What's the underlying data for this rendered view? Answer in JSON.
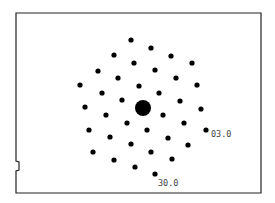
{
  "diagram": {
    "type": "diffraction-pattern",
    "frame": {
      "x": 16,
      "y": 13,
      "width": 245,
      "height": 180,
      "stroke": "#222222"
    },
    "center_spot": {
      "x": 143,
      "y": 108,
      "r": 8
    },
    "spot_radius": 2.6,
    "spot_color": "#000000",
    "spots": [
      [
        131,
        40
      ],
      [
        151,
        48
      ],
      [
        114,
        55
      ],
      [
        171,
        56
      ],
      [
        134,
        63
      ],
      [
        192,
        63
      ],
      [
        98,
        71
      ],
      [
        155,
        70
      ],
      [
        118,
        78
      ],
      [
        176,
        78
      ],
      [
        80,
        85
      ],
      [
        139,
        86
      ],
      [
        197,
        85
      ],
      [
        102,
        93
      ],
      [
        159,
        93
      ],
      [
        122,
        100
      ],
      [
        180,
        101
      ],
      [
        85,
        107
      ],
      [
        201,
        109
      ],
      [
        106,
        115
      ],
      [
        163,
        115
      ],
      [
        127,
        123
      ],
      [
        184,
        123
      ],
      [
        89,
        130
      ],
      [
        147,
        130
      ],
      [
        206,
        130
      ],
      [
        110,
        137
      ],
      [
        168,
        138
      ],
      [
        131,
        144
      ],
      [
        188,
        145
      ],
      [
        93,
        152
      ],
      [
        151,
        152
      ],
      [
        114,
        160
      ],
      [
        172,
        159
      ],
      [
        135,
        167
      ],
      [
        155,
        174
      ]
    ],
    "labels": [
      {
        "text": "03.0",
        "x": 211,
        "y": 137
      },
      {
        "text": "30.0",
        "x": 158,
        "y": 186
      }
    ]
  }
}
